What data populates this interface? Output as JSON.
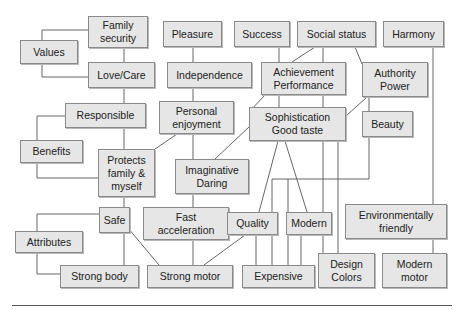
{
  "diagram": {
    "type": "means-end chain / value hierarchy",
    "colors": {
      "box_fill": "#e6e6e6",
      "box_border": "#8a8a8a",
      "line": "#555555"
    },
    "levels": {
      "values": "Values",
      "benefits": "Benefits",
      "attributes": "Attributes"
    },
    "nodes": {
      "family_security": "Family\nsecurity",
      "values": "Values",
      "love_care": "Love/Care",
      "pleasure": "Pleasure",
      "success": "Success",
      "social_status": "Social status",
      "harmony": "Harmony",
      "independence": "Independence",
      "achievement": "Achievement\nPerformance",
      "authority": "Authority\nPower",
      "responsible": "Responsible",
      "personal_enjoyment": "Personal\nenjoyment",
      "sophistication": "Sophistication\nGood taste",
      "beauty": "Beauty",
      "benefits": "Benefits",
      "protects": "Protects\nfamily &\nmyself",
      "imaginative": "Imaginative\nDaring",
      "safe": "Safe",
      "fast_acceleration": "Fast\nacceleration",
      "quality": "Quality",
      "modern": "Modern",
      "environmentally_friendly": "Environmentally\nfriendly",
      "attributes": "Attributes",
      "strong_body": "Strong body",
      "strong_motor": "Strong motor",
      "expensive": "Expensive",
      "design_colors": "Design\nColors",
      "modern_motor": "Modern\nmotor"
    },
    "links": [
      [
        "Family security",
        "Love/Care"
      ],
      [
        "Love/Care",
        "Responsible"
      ],
      [
        "Responsible",
        "Protects family & myself"
      ],
      [
        "Pleasure",
        "Independence"
      ],
      [
        "Independence",
        "Personal enjoyment"
      ],
      [
        "Personal enjoyment",
        "Protects family & myself"
      ],
      [
        "Personal enjoyment",
        "Imaginative Daring"
      ],
      [
        "Success",
        "Achievement Performance"
      ],
      [
        "Social status",
        "Achievement Performance"
      ],
      [
        "Social status",
        "Authority Power"
      ],
      [
        "Achievement Performance",
        "Sophistication Good taste"
      ],
      [
        "Achievement Performance",
        "Imaginative Daring"
      ],
      [
        "Authority Power",
        "Sophistication Good taste"
      ],
      [
        "Authority Power",
        "Beauty"
      ],
      [
        "Harmony",
        "Environmentally friendly"
      ],
      [
        "Protects family & myself",
        "Safe"
      ],
      [
        "Imaginative Daring",
        "Fast acceleration"
      ],
      [
        "Sophistication Good taste",
        "Quality"
      ],
      [
        "Sophistication Good taste",
        "Modern"
      ],
      [
        "Sophistication Good taste",
        "Design Colors"
      ],
      [
        "Beauty",
        "Expensive"
      ],
      [
        "Beauty",
        "Design Colors"
      ],
      [
        "Safe",
        "Strong body"
      ],
      [
        "Safe",
        "Strong motor"
      ],
      [
        "Fast acceleration",
        "Strong motor"
      ],
      [
        "Quality",
        "Strong motor"
      ],
      [
        "Quality",
        "Expensive"
      ],
      [
        "Modern",
        "Expensive"
      ],
      [
        "Environmentally friendly",
        "Modern motor"
      ]
    ]
  }
}
